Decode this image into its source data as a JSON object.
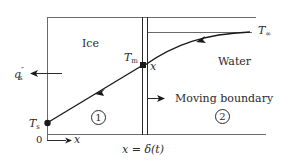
{
  "diagram": {
    "regions": [
      {
        "id": "1",
        "label": "Ice",
        "number": "1"
      },
      {
        "id": "2",
        "label": "Water",
        "number": "2"
      }
    ],
    "labels": {
      "ice": "Ice",
      "water": "Water",
      "moving_boundary": "Moving boundary",
      "region1_number": "1",
      "region2_number": "2",
      "T_infinity_main": "T",
      "T_infinity_sub": "∞",
      "T_m_main": "T",
      "T_m_sub": "m",
      "T_s_main": "T",
      "T_s_sub": "s",
      "q_main": "q",
      "q_prime": "″",
      "q_sub": "s",
      "x_at_interface": "x",
      "origin": "0",
      "x_axis": "x",
      "interface_position": "x = δ(t)"
    },
    "colors": {
      "line": "#6a6a6a",
      "curve": "#1a1a1a",
      "text": "#2a2a2a",
      "background": "#ffffff"
    }
  }
}
